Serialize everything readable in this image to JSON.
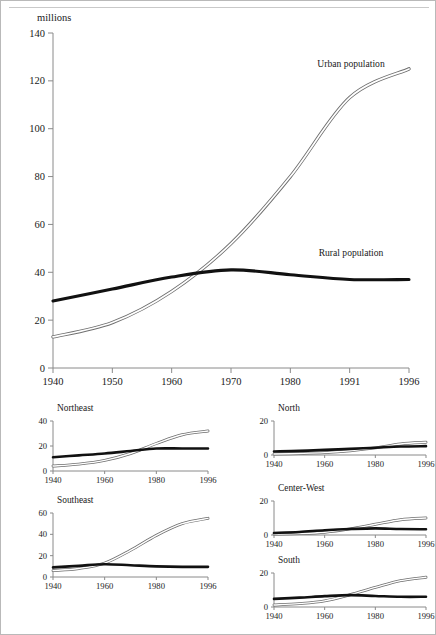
{
  "figure": {
    "background_color": "#ffffff",
    "border_color": "#b9b9b9",
    "rural_color": "#111111",
    "urban_color": "#6e6e6e"
  },
  "chart_data": [
    {
      "id": "main",
      "type": "line",
      "title": "",
      "xlabel": "",
      "ylabel": "millions",
      "x": [
        "1940",
        "1950",
        "1960",
        "1970",
        "1980",
        "1991",
        "1996"
      ],
      "xticklabels": [
        "1940",
        "1950",
        "1960",
        "1970",
        "1980",
        "1991",
        "1996"
      ],
      "ylim": [
        0,
        140
      ],
      "yticks": [
        0,
        20,
        40,
        60,
        80,
        100,
        120,
        140
      ],
      "yticklabels": [
        "0",
        "20",
        "40",
        "60",
        "80",
        "100",
        "120",
        "140"
      ],
      "grid": false,
      "legend_position": "inline-annotation",
      "series": [
        {
          "name": "Urban population",
          "style": "outlined",
          "values": [
            13,
            19,
            32,
            52,
            80,
            113,
            125
          ]
        },
        {
          "name": "Rural population",
          "style": "solid",
          "values": [
            28,
            33,
            38,
            41,
            39,
            37,
            37
          ]
        }
      ],
      "annotations": [
        {
          "text": "Urban population",
          "x": "1982",
          "y": 124
        },
        {
          "text": "Rural population",
          "x": "1982",
          "y": 48
        }
      ]
    },
    {
      "id": "northeast",
      "type": "line",
      "title": "Northeast",
      "xlabel": "",
      "ylabel": "",
      "x": [
        "1940",
        "1950",
        "1960",
        "1970",
        "1980",
        "1991",
        "1996"
      ],
      "xticks": [
        "1940",
        "1960",
        "1980",
        "1996"
      ],
      "xticklabels": [
        "1940",
        "1960",
        "1980",
        "1996"
      ],
      "ylim": [
        0,
        40
      ],
      "yticks": [
        0,
        20,
        40
      ],
      "yticklabels": [
        "0",
        "20",
        "40"
      ],
      "grid": false,
      "series": [
        {
          "name": "Urban population",
          "style": "outlined",
          "values": [
            4,
            5.5,
            8.5,
            14,
            22,
            29,
            32
          ]
        },
        {
          "name": "Rural population",
          "style": "solid",
          "values": [
            11,
            12.5,
            14,
            16,
            18,
            18,
            18
          ]
        }
      ]
    },
    {
      "id": "southeast",
      "type": "line",
      "title": "Southeast",
      "xlabel": "",
      "ylabel": "",
      "x": [
        "1940",
        "1950",
        "1960",
        "1970",
        "1980",
        "1991",
        "1996"
      ],
      "xticks": [
        "1940",
        "1960",
        "1980",
        "1996"
      ],
      "xticklabels": [
        "1940",
        "1960",
        "1980",
        "1996"
      ],
      "ylim": [
        0,
        60
      ],
      "yticks": [
        0,
        20,
        40,
        60
      ],
      "yticklabels": [
        "0",
        "20",
        "40",
        "60"
      ],
      "grid": false,
      "series": [
        {
          "name": "Urban population",
          "style": "outlined",
          "values": [
            6,
            8,
            13,
            25,
            39,
            50,
            55
          ]
        },
        {
          "name": "Rural population",
          "style": "solid",
          "values": [
            9,
            10.5,
            12,
            11,
            10,
            9.5,
            9.5
          ]
        }
      ]
    },
    {
      "id": "north",
      "type": "line",
      "title": "North",
      "xlabel": "",
      "ylabel": "",
      "x": [
        "1940",
        "1950",
        "1960",
        "1970",
        "1980",
        "1991",
        "1996"
      ],
      "xticks": [
        "1940",
        "1960",
        "1980",
        "1996"
      ],
      "xticklabels": [
        "1940",
        "1960",
        "1980",
        "1996"
      ],
      "ylim": [
        0,
        20
      ],
      "yticks": [
        0,
        20
      ],
      "yticklabels": [
        "0",
        "20"
      ],
      "grid": false,
      "series": [
        {
          "name": "Urban population",
          "style": "outlined",
          "values": [
            0.6,
            0.9,
            1.4,
            2.5,
            4.2,
            6.5,
            7.5
          ]
        },
        {
          "name": "Rural population",
          "style": "solid",
          "values": [
            2.1,
            2.4,
            3.0,
            3.6,
            4.3,
            5.0,
            5.2
          ]
        }
      ]
    },
    {
      "id": "center-west",
      "type": "line",
      "title": "Center-West",
      "xlabel": "",
      "ylabel": "",
      "x": [
        "1940",
        "1950",
        "1960",
        "1970",
        "1980",
        "1991",
        "1996"
      ],
      "xticks": [
        "1940",
        "1960",
        "1980",
        "1996"
      ],
      "xticklabels": [
        "1940",
        "1960",
        "1980",
        "1996"
      ],
      "ylim": [
        0,
        20
      ],
      "yticks": [
        0,
        20
      ],
      "yticklabels": [
        "0",
        "20"
      ],
      "grid": false,
      "series": [
        {
          "name": "Urban population",
          "style": "outlined",
          "values": [
            0.5,
            0.8,
            1.6,
            3.6,
            6.3,
            9.0,
            10.0
          ]
        },
        {
          "name": "Rural population",
          "style": "solid",
          "values": [
            1.2,
            1.8,
            2.8,
            3.5,
            3.9,
            3.5,
            3.4
          ]
        }
      ]
    },
    {
      "id": "south",
      "type": "line",
      "title": "South",
      "xlabel": "",
      "ylabel": "",
      "x": [
        "1940",
        "1950",
        "1960",
        "1970",
        "1980",
        "1991",
        "1996"
      ],
      "xticks": [
        "1940",
        "1960",
        "1980",
        "1996"
      ],
      "xticklabels": [
        "1940",
        "1960",
        "1980",
        "1996"
      ],
      "ylim": [
        0,
        20
      ],
      "yticks": [
        0,
        20
      ],
      "yticklabels": [
        "0",
        "20"
      ],
      "grid": false,
      "series": [
        {
          "name": "Urban population",
          "style": "outlined",
          "values": [
            1.2,
            2.0,
            3.6,
            7.2,
            11.5,
            15.5,
            17.5
          ]
        },
        {
          "name": "Rural population",
          "style": "solid",
          "values": [
            4.8,
            5.5,
            6.4,
            7.0,
            6.5,
            6.0,
            6.0
          ]
        }
      ]
    }
  ]
}
